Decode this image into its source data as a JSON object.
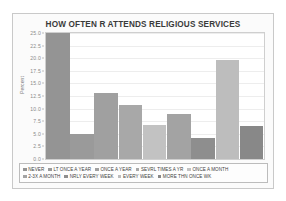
{
  "figure": {
    "background_color": "#fbfbfb",
    "border_color": "#c9c9c9",
    "plot_background": "#ffffff"
  },
  "chart_data": {
    "type": "bar",
    "title": "HOW OFTEN R ATTENDS RELIGIOUS SERVICES",
    "xlabel": "",
    "ylabel": "Percent",
    "ylim": [
      0.0,
      25.0
    ],
    "yticks": [
      "0.0",
      "2.5",
      "5.0",
      "7.5",
      "10.0",
      "12.5",
      "15.0",
      "17.5",
      "20.0",
      "22.5",
      "25.0"
    ],
    "ytick_values": [
      0.0,
      2.5,
      5.0,
      7.5,
      10.0,
      12.5,
      15.0,
      17.5,
      20.0,
      22.5,
      25.0
    ],
    "grid": true,
    "legend_position": "bottom",
    "categories": [
      "NEVER",
      "LT ONCE A YEAR",
      "ONCE A YEAR",
      "SEVRL TIMES A YR",
      "ONCE A MONTH",
      "2-3X A MONTH",
      "NRLY EVERY WEEK",
      "EVERY WEEK",
      "MORE THN ONCE WK"
    ],
    "values": [
      25.0,
      5.0,
      13.0,
      10.7,
      6.8,
      9.0,
      4.1,
      19.7,
      6.6
    ],
    "colors": [
      "#949494",
      "#9a9a9a",
      "#a0a0a0",
      "#a8a8a8",
      "#c2c2c2",
      "#a3a3a3",
      "#8e8e8e",
      "#bdbdbd",
      "#888888"
    ]
  },
  "legend": {
    "rows": [
      [
        {
          "label": "NEVER",
          "color": "#949494"
        },
        {
          "label": "LT ONCE A YEAR",
          "color": "#9a9a9a"
        },
        {
          "label": "ONCE A YEAR",
          "color": "#a0a0a0"
        },
        {
          "label": "SEVRL TIMES A YR",
          "color": "#a8a8a8"
        },
        {
          "label": "ONCE A MONTH",
          "color": "#c2c2c2"
        }
      ],
      [
        {
          "label": "2-3X A MONTH",
          "color": "#a3a3a3"
        },
        {
          "label": "NRLY EVERY WEEK",
          "color": "#8e8e8e"
        },
        {
          "label": "EVERY WEEK",
          "color": "#bdbdbd"
        },
        {
          "label": "MORE THN ONCE WK",
          "color": "#888888"
        }
      ]
    ]
  }
}
